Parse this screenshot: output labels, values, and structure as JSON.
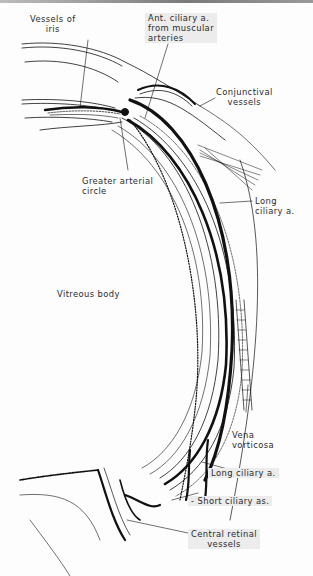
{
  "figure": {
    "labels": {
      "vessels_of_iris": "Vessels of\niris",
      "ant_ciliary": "Ant. ciliary a.\nfrom muscular\narteries",
      "conjunctival": "Conjunctival\nvessels",
      "greater_arterial_circle": "Greater arterial\ncircle",
      "long_ciliary_upper": "Long\nciliary a.",
      "vitreous_body": "Vitreous body",
      "vena_vorticosa": "Vena\nvorticosa",
      "long_ciliary_lower": "Long ciliary a.",
      "short_ciliary": "- Short ciliary as.",
      "central_retinal": "Central retinal\nvessels"
    },
    "colors": {
      "ink": "#111111",
      "paper": "#fdfdfd",
      "label_highlight": "#ececec"
    }
  }
}
